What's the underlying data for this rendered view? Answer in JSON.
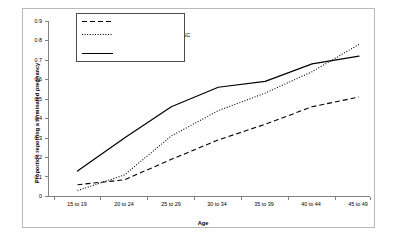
{
  "chart_data": {
    "type": "line",
    "title": "",
    "xlabel": "Age",
    "ylabel": "Proportion reporting a terminated pregnancy",
    "categories": [
      "15 to 19",
      "20 to 24",
      "25 to 29",
      "30 to 34",
      "35 to 39",
      "40 to 44",
      "45 to 49"
    ],
    "ylim": [
      0,
      0.9
    ],
    "yticks": [
      "0",
      "0.1",
      "0.2",
      "0.3",
      "0.4",
      "0.5",
      "0.6",
      "0.7",
      "0.8",
      "0.9"
    ],
    "ytick_values": [
      0,
      0.1,
      0.2,
      0.3,
      0.4,
      0.5,
      0.6,
      0.7,
      0.8,
      0.9
    ],
    "grid": false,
    "legend_position": "top-left",
    "series": [
      {
        "name": "DHS: All women",
        "style": "dashed",
        "color": "#000000",
        "values": [
          0.06,
          0.085,
          0.19,
          0.29,
          0.37,
          0.46,
          0.51
        ]
      },
      {
        "name": "DHS: Educated women in SC Province",
        "style": "dotted",
        "color": "#000000",
        "values": [
          0.03,
          0.11,
          0.31,
          0.44,
          0.53,
          0.64,
          0.78
        ]
      },
      {
        "name": "Johnson-Hanks data",
        "style": "solid",
        "color": "#000000",
        "values": [
          0.13,
          0.3,
          0.46,
          0.56,
          0.59,
          0.68,
          0.72
        ]
      }
    ]
  },
  "legend": {
    "entries": [
      {
        "label": "DHS: All women"
      },
      {
        "label": "DHS: Educated women in SC",
        "label_line2": "Province"
      },
      {
        "label": "Johnson-Hanks data"
      }
    ]
  },
  "axes": {
    "x_title": "Age",
    "y_title": "Proportion reporting a terminated pregnancy"
  },
  "colors": {
    "line": "#000000",
    "axis": "#808080",
    "frame": "#b9b9b9",
    "background": "#ffffff"
  }
}
